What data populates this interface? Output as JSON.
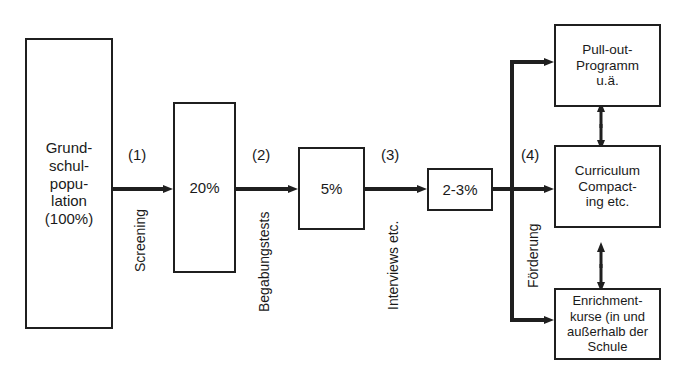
{
  "diagram": {
    "stages": [
      {
        "id": "population",
        "label": "Grund-\nschul-\npopu-\nlation\n(100%)",
        "percent": "100%"
      },
      {
        "id": "stage1",
        "label": "20%",
        "percent": "20%"
      },
      {
        "id": "stage2",
        "label": "5%",
        "percent": "5%"
      },
      {
        "id": "stage3",
        "label": "2-3%",
        "percent": "2-3%"
      }
    ],
    "steps": [
      {
        "number": "(1)",
        "label": "Screening"
      },
      {
        "number": "(2)",
        "label": "Begabungstests"
      },
      {
        "number": "(3)",
        "label": "Interviews etc."
      },
      {
        "number": "(4)",
        "label": "Förderung"
      }
    ],
    "outcomes": [
      {
        "id": "pull-out",
        "label": "Pull-out-\nProgramm\nu.ä."
      },
      {
        "id": "curriculum-compacting",
        "label": "Curriculum\nCompact-\ning etc."
      },
      {
        "id": "enrichment",
        "label": "Enrichment-\nkurse (in und\naußerhalb der\nSchule"
      }
    ],
    "colors": {
      "line": "#1f1f1f",
      "box_border": "#1f1f1f",
      "box_fill": "#ffffff",
      "text": "#1a1a1a",
      "background": "#ffffff"
    }
  }
}
